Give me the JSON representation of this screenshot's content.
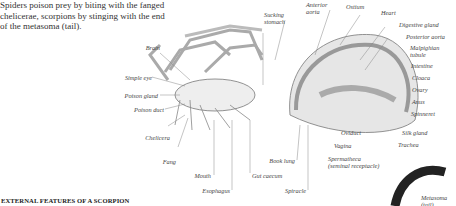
{
  "intro_text": "Spiders poison prey by biting with the fanged chelicerae, scorpions by stinging with the end of the metasoma (tail).",
  "section_title": "EXTERNAL FEATURES OF A SCORPION",
  "labels": {
    "brain": "Brain",
    "simple_eye": "Simple eye",
    "poison_gland": "Poison gland",
    "poison_duct": "Poison duct",
    "chelicera": "Chelicera",
    "fang": "Fang",
    "mouth": "Mouth",
    "esophagus": "Esophagus",
    "gut_caecum": "Gut caecum",
    "book_lung": "Book lung",
    "spiracle": "Spiracle",
    "sucking_stomach_1": "Sucking",
    "sucking_stomach_2": "stomach",
    "anterior_aorta_1": "Anterior",
    "anterior_aorta_2": "aorta",
    "ostium": "Ostium",
    "heart": "Heart",
    "digestive_gland": "Digestive gland",
    "posterior_aorta": "Posterior aorta",
    "malpighian_tubule_1": "Malpighian",
    "malpighian_tubule_2": "tubule",
    "intestine": "Intestine",
    "cloaca": "Cloaca",
    "ovary": "Ovary",
    "anus": "Anus",
    "spinneret": "Spinneret",
    "silk_gland": "Silk gland",
    "trachea": "Trachea",
    "oviduct": "Oviduct",
    "vagina": "Vagina",
    "spermatheca_1": "Spermatheca",
    "spermatheca_2": "(seminal receptacle)",
    "metasoma_1": "Metasoma",
    "metasoma_2": "(tail)"
  }
}
